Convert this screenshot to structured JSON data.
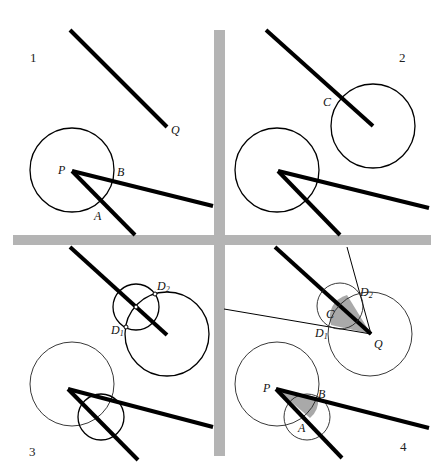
{
  "figure": {
    "panels": [
      {
        "number": "1",
        "points": {
          "P": "P",
          "Q": "Q",
          "A": "A",
          "B": "B"
        }
      },
      {
        "number": "2",
        "points": {
          "C": "C"
        }
      },
      {
        "number": "3",
        "points": {
          "D1": "D",
          "D1_sub": "1",
          "D2": "D",
          "D2_sub": "2"
        }
      },
      {
        "number": "4",
        "points": {
          "P": "P",
          "Q": "Q",
          "A": "A",
          "B": "B",
          "C": "C",
          "D1": "D",
          "D1_sub": "1",
          "D2": "D",
          "D2_sub": "2"
        }
      }
    ],
    "colors": {
      "separator": "#b4b4b4",
      "shade": "#a9a9a9",
      "ink": "#000000"
    }
  }
}
